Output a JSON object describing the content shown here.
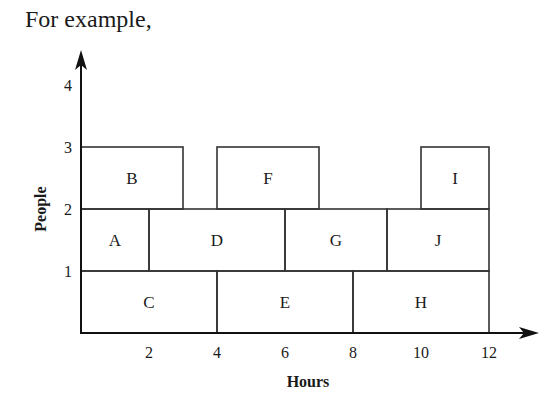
{
  "intro_text": "For example,",
  "chart_data": {
    "type": "diagram",
    "xlabel": "Hours",
    "ylabel": "People",
    "x_ticks": [
      2,
      4,
      6,
      8,
      10,
      12
    ],
    "y_ticks": [
      1,
      2,
      3,
      4
    ],
    "xlim": [
      0,
      12
    ],
    "ylim": [
      0,
      4
    ],
    "blocks": [
      {
        "label": "A",
        "x0": 0,
        "x1": 2,
        "y0": 1,
        "y1": 2
      },
      {
        "label": "B",
        "x0": 0,
        "x1": 3,
        "y0": 2,
        "y1": 3
      },
      {
        "label": "C",
        "x0": 0,
        "x1": 4,
        "y0": 0,
        "y1": 1
      },
      {
        "label": "D",
        "x0": 2,
        "x1": 6,
        "y0": 1,
        "y1": 2
      },
      {
        "label": "E",
        "x0": 4,
        "x1": 8,
        "y0": 0,
        "y1": 1
      },
      {
        "label": "F",
        "x0": 4,
        "x1": 7,
        "y0": 2,
        "y1": 3
      },
      {
        "label": "G",
        "x0": 6,
        "x1": 9,
        "y0": 1,
        "y1": 2
      },
      {
        "label": "H",
        "x0": 8,
        "x1": 12,
        "y0": 0,
        "y1": 1
      },
      {
        "label": "I",
        "x0": 10,
        "x1": 12,
        "y0": 2,
        "y1": 3
      },
      {
        "label": "J",
        "x0": 9,
        "x1": 12,
        "y0": 1,
        "y1": 2
      }
    ]
  }
}
